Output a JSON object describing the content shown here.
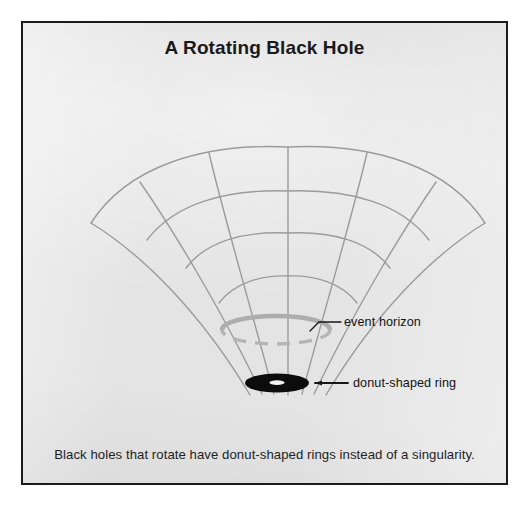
{
  "figure": {
    "title": "A Rotating Black Hole",
    "caption": "Black holes that rotate have donut-shaped rings instead of a singularity.",
    "background_color": "#e4e4e4",
    "border_color": "#1b1b1b",
    "page_background": "#ffffff"
  },
  "callouts": [
    {
      "id": "event-horizon",
      "label": "event horizon",
      "leader_from": [
        287,
        307
      ],
      "leader_to": [
        318,
        299
      ]
    },
    {
      "id": "donut-shaped-ring",
      "label": "donut-shaped ring",
      "leader_from": [
        292,
        360
      ],
      "leader_to": [
        326,
        360
      ]
    }
  ],
  "diagram": {
    "type": "spacetime-funnel",
    "grid_color": "#9b9b9b",
    "grid_stroke_width": 1.4,
    "apex": [
      265,
      370
    ],
    "top_center": [
      265,
      124
    ],
    "outer_arc_left_tip": [
      68,
      200
    ],
    "outer_arc_right_tip": [
      462,
      200
    ],
    "radial_lines": 7,
    "ring_count": 4,
    "event_horizon": {
      "center": [
        253,
        307
      ],
      "radius_x": 54,
      "radius_y": 14,
      "color": "#adadad",
      "top_stroke_width": 4.5,
      "bottom_style": "dashed"
    },
    "donut_ring": {
      "center": [
        254,
        360
      ],
      "radius_x": 32,
      "radius_y": 9.5,
      "fill": "#0c0c0c",
      "hole_radius_x": 7.5,
      "hole_radius_y": 2.2,
      "hole_fill": "#f2f2f2"
    }
  }
}
